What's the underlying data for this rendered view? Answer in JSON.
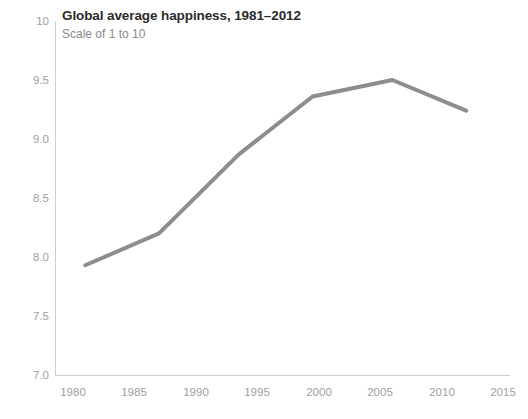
{
  "chart_data": {
    "type": "line",
    "title": "Global average happiness, 1981–2012",
    "subtitle": "Scale of 1 to 10",
    "xlabel": "",
    "ylabel": "",
    "grid": false,
    "legend": "none",
    "line_color": "#8d8d8d",
    "xlim": [
      1978,
      2017
    ],
    "ylim": [
      7.0,
      10.0
    ],
    "x_ticks": [
      "1980",
      "1985",
      "1990",
      "1995",
      "2000",
      "2005",
      "2010",
      "2015"
    ],
    "x_tick_values": [
      1980,
      1985,
      1990,
      1995,
      2000,
      2005,
      2010,
      2015
    ],
    "y_ticks": [
      "10",
      "9.5",
      "9.0",
      "8.5",
      "8.0",
      "7.5",
      "7.0"
    ],
    "y_tick_values": [
      10,
      9.5,
      9.0,
      8.5,
      8.0,
      7.5,
      7.0
    ],
    "series": [
      {
        "name": "Global average happiness",
        "x": [
          1981,
          1987,
          1993.5,
          1999.5,
          2006,
          2012
        ],
        "values": [
          7.93,
          8.2,
          8.87,
          9.36,
          9.5,
          9.24
        ]
      }
    ]
  }
}
